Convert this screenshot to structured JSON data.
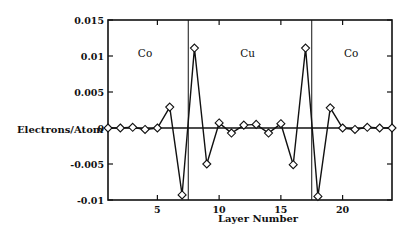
{
  "chart_data": {
    "type": "line",
    "title": "",
    "xlabel": "Layer Number",
    "ylabel": "Electrons/Atom",
    "xlim": [
      1,
      24
    ],
    "ylim": [
      -0.01,
      0.015
    ],
    "x_ticks": [
      5,
      10,
      15,
      20
    ],
    "x_tick_labels": [
      "5",
      "10",
      "15",
      "20"
    ],
    "y_ticks": [
      -0.01,
      -0.005,
      0,
      0.005,
      0.01,
      0.015
    ],
    "y_tick_labels": [
      "-0.01",
      "-0.005",
      "0",
      "0.005",
      "0.01",
      "0.015"
    ],
    "grid": false,
    "marker": "diamond-open",
    "zero_line": true,
    "region_dividers": [
      7.5,
      17.5
    ],
    "regions": [
      {
        "label": "Co",
        "x": 4,
        "y": 0.0098
      },
      {
        "label": "Cu",
        "x": 12.3,
        "y": 0.0098
      },
      {
        "label": "Co",
        "x": 20.7,
        "y": 0.0098
      }
    ],
    "series": [
      {
        "name": "Electrons/Atom",
        "x": [
          1,
          2,
          3,
          4,
          5,
          6,
          7,
          8,
          9,
          10,
          11,
          12,
          13,
          14,
          15,
          16,
          17,
          18,
          19,
          20,
          21,
          22,
          23,
          24
        ],
        "values": [
          0.0,
          0.0,
          0.0001,
          -0.0002,
          0.0,
          0.0029,
          -0.0093,
          0.0111,
          -0.005,
          0.0007,
          -0.0007,
          0.0004,
          0.0005,
          -0.0007,
          0.0006,
          -0.0051,
          0.0111,
          -0.0095,
          0.0028,
          0.0,
          -0.0002,
          0.0001,
          0.0,
          0.0
        ]
      }
    ]
  }
}
